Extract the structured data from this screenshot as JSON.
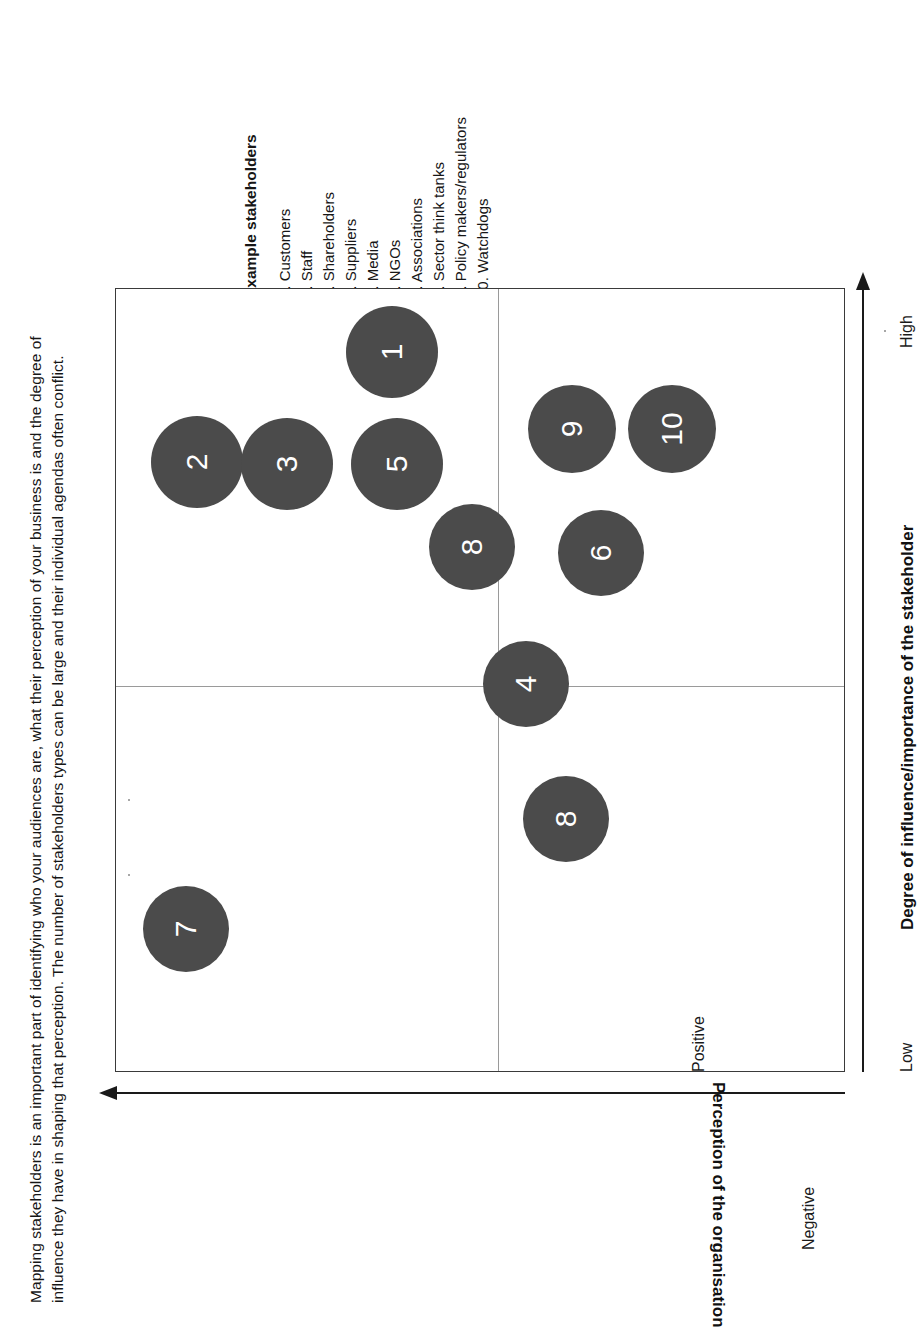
{
  "caption": {
    "line1": "Mapping stakeholders is an important part of identifying who your audiences are, what their perception of your business is and the degree of",
    "line2": "influence they have in shaping that perception. The number of stakeholders types can be large and their individual agendas often conflict."
  },
  "legend": {
    "heading": "Example stakeholders",
    "items": [
      "1. Customers",
      "2. Staff",
      "3. Shareholders",
      "4. Suppliers",
      "5. Media",
      "6. NGOs",
      "7. Associations",
      "8. Sector think tanks",
      "9. Policy makers/regulators",
      "10. Watchdogs"
    ]
  },
  "axes": {
    "x_title": "Degree of influence/importance of the stakeholder",
    "x_low": "Low",
    "x_high": "High",
    "y_title": "Perception of the organisation",
    "y_positive": "Positive",
    "y_negative": "Negative"
  },
  "style": {
    "bubble_fill": "#4b4b4b",
    "bubble_text": "#ffffff",
    "frame": "#3a3a3a",
    "divider": "#9a9a9a",
    "axis": "#1a1a1a"
  },
  "chart_data": {
    "type": "scatter",
    "xlabel": "Degree of influence/importance of the stakeholder",
    "ylabel": "Perception of the organisation",
    "xlim": [
      0,
      100
    ],
    "ylim": [
      0,
      100
    ],
    "xtick_labels": [
      "Low",
      "High"
    ],
    "ytick_labels": [
      "Negative",
      "Positive"
    ],
    "grid": false,
    "quadrant_divider_x": 51,
    "quadrant_divider_y": 49,
    "points": [
      {
        "id": 1,
        "label": "1",
        "name": "Customers",
        "x": 8,
        "y": 92,
        "size": 90
      },
      {
        "id": 2,
        "label": "2",
        "name": "Staff",
        "x": 22,
        "y": 11,
        "size": 90
      },
      {
        "id": 3,
        "label": "3",
        "name": "Shareholders",
        "x": 22,
        "y": 23,
        "size": 90
      },
      {
        "id": 4,
        "label": "4",
        "name": "Suppliers",
        "x": 50,
        "y": 56,
        "size": 84
      },
      {
        "id": 5,
        "label": "5",
        "name": "Media",
        "x": 22,
        "y": 38,
        "size": 90
      },
      {
        "id": 6,
        "label": "6",
        "name": "NGOs",
        "x": 34,
        "y": 66,
        "size": 84
      },
      {
        "id": 7,
        "label": "7",
        "name": "Associations",
        "x": 82,
        "y": 10,
        "size": 84
      },
      {
        "id": 8,
        "label": "8",
        "name": "Sector think tanks",
        "x": 33,
        "y": 49,
        "size": 84
      },
      {
        "id": 8,
        "label": "8",
        "name": "Sector think tanks",
        "x": 68,
        "y": 62,
        "size": 84
      },
      {
        "id": 9,
        "label": "9",
        "name": "Policy makers/regulators",
        "x": 18,
        "y": 62,
        "size": 86
      },
      {
        "id": 10,
        "label": "10",
        "name": "Watchdogs",
        "x": 18,
        "y": 76,
        "size": 86
      }
    ]
  },
  "bubbles": [
    {
      "label": "1",
      "left": 230,
      "top": 17,
      "size": 92
    },
    {
      "label": "2",
      "left": 35,
      "top": 127,
      "size": 92
    },
    {
      "label": "3",
      "left": 125,
      "top": 129,
      "size": 92
    },
    {
      "label": "5",
      "left": 235,
      "top": 129,
      "size": 92
    },
    {
      "label": "9",
      "left": 412,
      "top": 96,
      "size": 88
    },
    {
      "label": "10",
      "left": 512,
      "top": 96,
      "size": 88
    },
    {
      "label": "8",
      "left": 313,
      "top": 215,
      "size": 86
    },
    {
      "label": "6",
      "left": 442,
      "top": 221,
      "size": 86
    },
    {
      "label": "4",
      "left": 367,
      "top": 352,
      "size": 86
    },
    {
      "label": "8",
      "left": 407,
      "top": 487,
      "size": 86
    },
    {
      "label": "7",
      "left": 27,
      "top": 597,
      "size": 86
    }
  ]
}
